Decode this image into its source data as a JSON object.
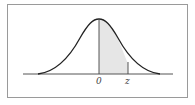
{
  "diagram": {
    "labels": {
      "origin": "0",
      "z": "z"
    },
    "colors": {
      "curve": "#222222",
      "shade": "#e6e6e6",
      "axis": "#555555",
      "frame": "#9a9a9a"
    }
  }
}
